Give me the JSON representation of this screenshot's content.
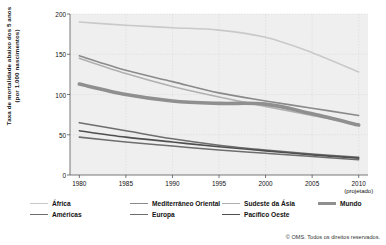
{
  "chart_data": {
    "type": "line",
    "title": "",
    "xlabel": "",
    "ylabel": "Taxa de mortalidade abaixo dos 5 anos (por 1.000 nascimentos)",
    "ylabel_line1": "Taxa de mortalidade abaixo dos 5 anos",
    "ylabel_line2": "(por 1.000 nascimentos)",
    "x": [
      1980,
      1985,
      1990,
      1995,
      2000,
      2005,
      2010
    ],
    "xtick_labels": [
      "1980",
      "1985",
      "1990",
      "1995",
      "2000",
      "2005",
      "2010"
    ],
    "xtick_sublabels": [
      "",
      "",
      "",
      "",
      "",
      "",
      "(projetado)"
    ],
    "ytick_labels": [
      "0",
      "50",
      "100",
      "150",
      "200"
    ],
    "ylim": [
      0,
      200
    ],
    "xlim": [
      1979,
      2011
    ],
    "grid": true,
    "legend_position": "bottom",
    "series": [
      {
        "name": "África",
        "color": "#c9c9c9",
        "width": 1.6,
        "values": [
          190,
          186,
          183,
          180,
          171,
          152,
          128
        ]
      },
      {
        "name": "Américas",
        "color": "#6e6e6e",
        "width": 1.6,
        "values": [
          65,
          55,
          45,
          37,
          31,
          26,
          22
        ]
      },
      {
        "name": "Mediterrâneo Oriental",
        "color": "#8a8a8a",
        "width": 1.6,
        "values": [
          148,
          130,
          116,
          102,
          92,
          83,
          74
        ]
      },
      {
        "name": "Europa",
        "color": "#6e6e6e",
        "width": 1.6,
        "values": [
          47,
          41,
          36,
          31,
          27,
          23,
          19
        ]
      },
      {
        "name": "Sudeste da Ásia",
        "color": "#b0b0b0",
        "width": 1.6,
        "values": [
          145,
          126,
          110,
          97,
          85,
          74,
          63
        ]
      },
      {
        "name": "Pacífico Oeste",
        "color": "#4f4f4f",
        "width": 1.6,
        "values": [
          55,
          47,
          41,
          35,
          30,
          25,
          21
        ]
      },
      {
        "name": "Mundo",
        "color": "#8f8f8f",
        "width": 3.6,
        "values": [
          113,
          100,
          92,
          89,
          88,
          76,
          62
        ]
      }
    ]
  },
  "legend": {
    "items": [
      {
        "label": "África",
        "color": "#c9c9c9",
        "width": 1.6,
        "row": 0,
        "col": 0
      },
      {
        "label": "Mediterrâneo Oriental",
        "color": "#8a8a8a",
        "width": 1.6,
        "row": 0,
        "col": 1
      },
      {
        "label": "Sudeste da Ásia",
        "color": "#b0b0b0",
        "width": 1.6,
        "row": 0,
        "col": 2
      },
      {
        "label": "Mundo",
        "color": "#8f8f8f",
        "width": 3.6,
        "row": 0,
        "col": 3
      },
      {
        "label": "Américas",
        "color": "#6e6e6e",
        "width": 1.6,
        "row": 1,
        "col": 0
      },
      {
        "label": "Europa",
        "color": "#6e6e6e",
        "width": 1.6,
        "row": 1,
        "col": 1
      },
      {
        "label": "Pacífico Oeste",
        "color": "#4f4f4f",
        "width": 1.6,
        "row": 1,
        "col": 2
      }
    ]
  },
  "footer": {
    "copyright": "© OMS. Todos os direitos reservados."
  },
  "colors": {
    "plot_background": "#efefef",
    "axis": "#555555",
    "grid": "#d8d8d8",
    "text": "#111111"
  }
}
